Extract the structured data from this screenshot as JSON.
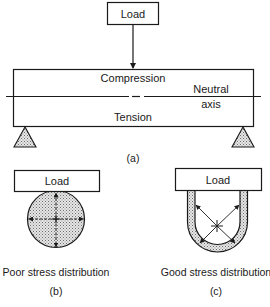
{
  "figure_a": {
    "load_label": "Load",
    "compression_label": "Compression",
    "tension_label": "Tension",
    "neutral_label_line1": "Neutral",
    "neutral_label_line2": "axis",
    "caption": "(a)"
  },
  "figure_b": {
    "load_label": "Load",
    "description": "Poor stress distribution",
    "caption": "(b)"
  },
  "figure_c": {
    "load_label": "Load",
    "description": "Good stress distribution",
    "caption": "(c)"
  },
  "colors": {
    "stroke": "#1a1a1a",
    "fill_stipple": "#cfcfcf",
    "background": "#ffffff"
  }
}
